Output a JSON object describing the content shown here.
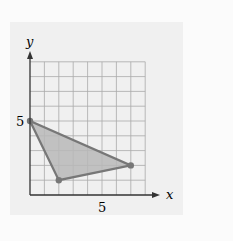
{
  "figure": {
    "axis_labels": {
      "x": "x",
      "y": "y"
    },
    "tick_labels": {
      "x": "5",
      "y": "5"
    },
    "grid": {
      "x_max": 8,
      "y_max": 9
    },
    "triangle": {
      "vertices": [
        [
          0,
          5
        ],
        [
          2,
          1
        ],
        [
          7,
          2
        ]
      ],
      "fill": "#b8b8b8",
      "stroke": "#777777"
    },
    "colors": {
      "panel": "#f0f0f0",
      "grid": "#aaaaaa",
      "axis": "#333333"
    }
  }
}
